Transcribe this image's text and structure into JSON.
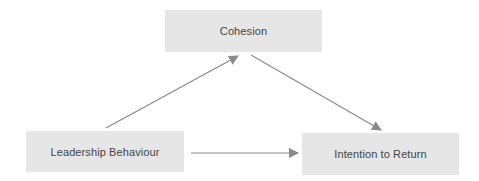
{
  "diagram": {
    "type": "mediation-model",
    "nodes": [
      {
        "id": "cohesion",
        "label": "Cohesion"
      },
      {
        "id": "leadership",
        "label": "Leadership Behaviour"
      },
      {
        "id": "intention",
        "label": "Intention to Return"
      }
    ],
    "edges": [
      {
        "from": "leadership",
        "to": "cohesion"
      },
      {
        "from": "cohesion",
        "to": "intention"
      },
      {
        "from": "leadership",
        "to": "intention"
      }
    ]
  },
  "colors": {
    "node_fill": "#e6e6e6",
    "node_text": "#444444",
    "arrow": "#8a8a8a",
    "background": "#ffffff"
  }
}
